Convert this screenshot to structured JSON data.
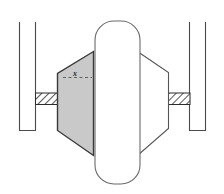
{
  "figure": {
    "background_color": "#ffffff",
    "stroke_color": "#3a3a3a",
    "shaded_fill": "#c9c9c9",
    "plain_fill": "#ffffff",
    "hatch_color": "#2b2b2b",
    "dimension_label": "x",
    "canvas": {
      "width": 224,
      "height": 194
    }
  },
  "annotations": {
    "dimension_x": {
      "label": "x",
      "note": "dashed horizontal dimension line across the shaded body"
    }
  },
  "parts": {
    "left_rail": {
      "name": "left-vertical-rail"
    },
    "right_rail": {
      "name": "right-vertical-rail"
    },
    "left_hatch_bar": {
      "name": "left-hatched-bar"
    },
    "right_hatch_bar": {
      "name": "right-hatched-bar"
    },
    "shaded_body": {
      "name": "left-shaded-hub-body"
    },
    "plain_body": {
      "name": "right-hub-body"
    },
    "wheel": {
      "name": "center-wheel-tire"
    }
  }
}
